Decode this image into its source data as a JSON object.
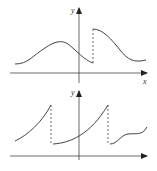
{
  "figure": {
    "colors": {
      "stroke": "#444444",
      "background": "#ffffff"
    },
    "top_graph": {
      "y_axis_label": "y",
      "x_axis_label": "x",
      "features": [
        "smooth bump left of y-axis",
        "jump discontinuity right of y-axis (dashed)",
        "decreasing S-curve after jump"
      ]
    },
    "bottom_graph": {
      "y_axis_label": "y",
      "features": [
        "increasing convex segment",
        "dashed jump down",
        "increasing convex segment through y-axis",
        "dashed jump down",
        "wavy segment"
      ]
    }
  }
}
